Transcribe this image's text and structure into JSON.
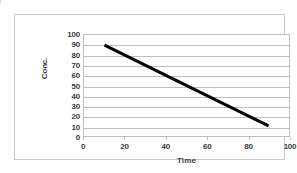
{
  "figure": {
    "label_fragment": ")"
  },
  "chart_data": {
    "type": "line",
    "title": "",
    "xlabel": "Time",
    "ylabel": "Conc.",
    "xlim": [
      0,
      100
    ],
    "ylim": [
      0,
      100
    ],
    "xticks": [
      0,
      20,
      40,
      60,
      80,
      100
    ],
    "yticks": [
      0,
      10,
      20,
      30,
      40,
      50,
      60,
      70,
      80,
      90,
      100
    ],
    "xtick_labels": [
      "0",
      "20",
      "40",
      "60",
      "80",
      "100"
    ],
    "ytick_labels": [
      "0",
      "10",
      "20",
      "30",
      "40",
      "50",
      "60",
      "70",
      "80",
      "90",
      "100"
    ],
    "grid": "horizontal",
    "legend": "none",
    "series": [
      {
        "name": "concentration",
        "color": "#000000",
        "line_width": 3,
        "x": [
          10,
          90
        ],
        "values": [
          90,
          10
        ],
        "points": [
          [
            10,
            90
          ],
          [
            90,
            10
          ]
        ]
      }
    ]
  },
  "style": {
    "plot_background": "#ffffff",
    "grid_color": "#bdbdbd",
    "axis_color": "#bfbfbf",
    "frame_color": "#c9c9c9",
    "text_color": "#3c3c3c",
    "line_color": "#000000"
  }
}
